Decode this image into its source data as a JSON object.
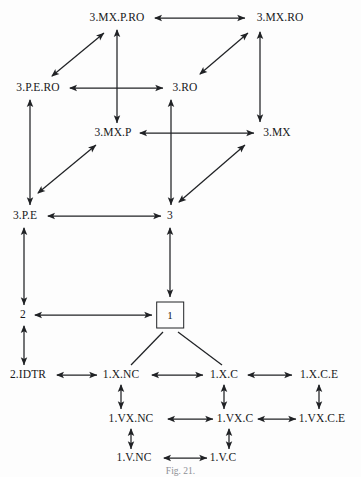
{
  "figure": {
    "caption": "Fig. 21.",
    "background_color": "#fdfdfd",
    "stroke_color": "#202225",
    "text_color": "#17181a"
  },
  "nodes": [
    {
      "id": "mx-p-ro",
      "label": "3.MX.P.RO",
      "x": 117,
      "y": 18,
      "boxed": false
    },
    {
      "id": "mx-ro",
      "label": "3.MX.RO",
      "x": 280,
      "y": 18,
      "boxed": false
    },
    {
      "id": "p-e-ro",
      "label": "3.P.E.RO",
      "x": 38,
      "y": 88,
      "boxed": false
    },
    {
      "id": "ro",
      "label": "3.RO",
      "x": 185,
      "y": 88,
      "boxed": false
    },
    {
      "id": "mx-p",
      "label": "3.MX.P",
      "x": 113,
      "y": 133,
      "boxed": false
    },
    {
      "id": "mx",
      "label": "3.MX",
      "x": 277,
      "y": 133,
      "boxed": false
    },
    {
      "id": "p-e",
      "label": "3.P.E",
      "x": 25,
      "y": 216,
      "boxed": false
    },
    {
      "id": "three",
      "label": "3",
      "x": 170,
      "y": 216,
      "boxed": false
    },
    {
      "id": "two",
      "label": "2",
      "x": 23,
      "y": 315,
      "boxed": false
    },
    {
      "id": "one",
      "label": "1",
      "x": 170,
      "y": 315,
      "boxed": true
    },
    {
      "id": "idtr",
      "label": "2.IDTR",
      "x": 28,
      "y": 375,
      "boxed": false
    },
    {
      "id": "x-nc",
      "label": "1.X.NC",
      "x": 121,
      "y": 375,
      "boxed": false
    },
    {
      "id": "x-c",
      "label": "1.X.C",
      "x": 224,
      "y": 375,
      "boxed": false
    },
    {
      "id": "x-c-e",
      "label": "1.X.C.E",
      "x": 319,
      "y": 375,
      "boxed": false
    },
    {
      "id": "vx-nc",
      "label": "1.VX.NC",
      "x": 131,
      "y": 419,
      "boxed": false
    },
    {
      "id": "vx-c",
      "label": "1.VX.C",
      "x": 235,
      "y": 419,
      "boxed": false
    },
    {
      "id": "vx-c-e",
      "label": "1.VX.C.E",
      "x": 322,
      "y": 419,
      "boxed": false
    },
    {
      "id": "v-nc",
      "label": "1.V.NC",
      "x": 134,
      "y": 458,
      "boxed": false
    },
    {
      "id": "v-c",
      "label": "1.V.C",
      "x": 223,
      "y": 458,
      "boxed": false
    }
  ],
  "edges": [
    {
      "from": "mx-p-ro",
      "to": "mx-ro",
      "arrows": "both",
      "x1": 155,
      "y1": 18,
      "x2": 245,
      "y2": 18
    },
    {
      "from": "p-e-ro",
      "to": "ro",
      "arrows": "both",
      "x1": 70,
      "y1": 88,
      "x2": 163,
      "y2": 88
    },
    {
      "from": "mx-p",
      "to": "mx",
      "arrows": "both",
      "x1": 140,
      "y1": 133,
      "x2": 254,
      "y2": 133
    },
    {
      "from": "p-e",
      "to": "three",
      "arrows": "both",
      "x1": 48,
      "y1": 216,
      "x2": 161,
      "y2": 216
    },
    {
      "from": "two",
      "to": "one",
      "arrows": "both",
      "x1": 35,
      "y1": 315,
      "x2": 152,
      "y2": 315
    },
    {
      "from": "idtr",
      "to": "x-nc",
      "arrows": "both",
      "x1": 57,
      "y1": 375,
      "x2": 97,
      "y2": 375
    },
    {
      "from": "x-nc",
      "to": "x-c",
      "arrows": "both",
      "x1": 152,
      "y1": 375,
      "x2": 203,
      "y2": 375
    },
    {
      "from": "x-c",
      "to": "x-c-e",
      "arrows": "both",
      "x1": 248,
      "y1": 375,
      "x2": 292,
      "y2": 375
    },
    {
      "from": "vx-nc",
      "to": "vx-c",
      "arrows": "both",
      "x1": 168,
      "y1": 419,
      "x2": 213,
      "y2": 419
    },
    {
      "from": "vx-c",
      "to": "vx-c-e",
      "arrows": "both",
      "x1": 258,
      "y1": 419,
      "x2": 296,
      "y2": 419
    },
    {
      "from": "v-nc",
      "to": "v-c",
      "arrows": "both",
      "x1": 164,
      "y1": 458,
      "x2": 207,
      "y2": 458
    },
    {
      "from": "mx-p-ro",
      "to": "mx-p",
      "arrows": "both",
      "x1": 117,
      "y1": 30,
      "x2": 117,
      "y2": 123
    },
    {
      "from": "ro",
      "to": "three",
      "arrows": "both",
      "x1": 171,
      "y1": 100,
      "x2": 171,
      "y2": 205
    },
    {
      "from": "mx-ro",
      "to": "mx",
      "arrows": "both",
      "x1": 260,
      "y1": 32,
      "x2": 260,
      "y2": 122
    },
    {
      "from": "p-e-ro",
      "to": "p-e",
      "arrows": "both",
      "x1": 30,
      "y1": 100,
      "x2": 30,
      "y2": 205
    },
    {
      "from": "p-e",
      "to": "two",
      "arrows": "both",
      "x1": 24,
      "y1": 228,
      "x2": 24,
      "y2": 305
    },
    {
      "from": "three",
      "to": "one",
      "arrows": "both",
      "x1": 170,
      "y1": 228,
      "x2": 170,
      "y2": 297
    },
    {
      "from": "two",
      "to": "idtr",
      "arrows": "both",
      "x1": 24,
      "y1": 326,
      "x2": 24,
      "y2": 365
    },
    {
      "from": "x-nc",
      "to": "vx-nc",
      "arrows": "both",
      "x1": 121,
      "y1": 385,
      "x2": 121,
      "y2": 409
    },
    {
      "from": "x-c",
      "to": "vx-c",
      "arrows": "both",
      "x1": 224,
      "y1": 385,
      "x2": 224,
      "y2": 409
    },
    {
      "from": "x-c-e",
      "to": "vx-c-e",
      "arrows": "both",
      "x1": 319,
      "y1": 385,
      "x2": 319,
      "y2": 409
    },
    {
      "from": "vx-nc",
      "to": "v-nc",
      "arrows": "both",
      "x1": 131,
      "y1": 429,
      "x2": 131,
      "y2": 449
    },
    {
      "from": "vx-c",
      "to": "v-c",
      "arrows": "both",
      "x1": 229,
      "y1": 429,
      "x2": 229,
      "y2": 449
    },
    {
      "from": "p-e-ro",
      "to": "mx-p-ro",
      "arrows": "both",
      "x1": 52,
      "y1": 76,
      "x2": 104,
      "y2": 33
    },
    {
      "from": "mx",
      "to": "mx-ro",
      "arrows": "both",
      "x1": 200,
      "y1": 74,
      "x2": 248,
      "y2": 33
    },
    {
      "from": "p-e",
      "to": "mx-p",
      "arrows": "both",
      "x1": 38,
      "y1": 193,
      "x2": 96,
      "y2": 145
    },
    {
      "from": "three",
      "to": "mx",
      "arrows": "both",
      "x1": 179,
      "y1": 202,
      "x2": 245,
      "y2": 145
    },
    {
      "from": "one",
      "to": "x-nc",
      "arrows": "none",
      "x1": 163,
      "y1": 332,
      "x2": 131,
      "y2": 365
    },
    {
      "from": "one",
      "to": "x-c",
      "arrows": "none",
      "x1": 178,
      "y1": 332,
      "x2": 222,
      "y2": 365
    }
  ]
}
